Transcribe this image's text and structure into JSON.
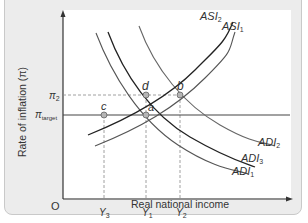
{
  "diagram": {
    "y_axis_label": "Rate of inflation (π)",
    "x_axis_label": "Real national income",
    "origin_label": "O",
    "y_ticks": [
      {
        "symbol": "π",
        "sub": "2"
      },
      {
        "symbol": "π",
        "sub": "target"
      }
    ],
    "x_ticks": [
      {
        "symbol": "Y",
        "sub": "3"
      },
      {
        "symbol": "Y",
        "sub": "1"
      },
      {
        "symbol": "Y",
        "sub": "2"
      }
    ],
    "curves": [
      {
        "name": "ASI",
        "sub": "2"
      },
      {
        "name": "ASI",
        "sub": "1"
      },
      {
        "name": "ADI",
        "sub": "2"
      },
      {
        "name": "ADI",
        "sub": "3"
      },
      {
        "name": "ADI",
        "sub": "1"
      }
    ],
    "points": [
      "a",
      "b",
      "c",
      "d"
    ],
    "colors": {
      "panel_bg": "#ececec",
      "plot_bg": "#ffffff",
      "line_dark": "#222222",
      "line_mid": "#555555",
      "line_light": "#777777",
      "point_fill": "#b5b5b5"
    }
  }
}
